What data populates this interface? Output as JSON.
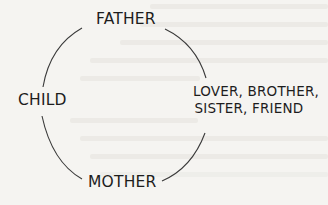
{
  "diagram": {
    "type": "cycle",
    "nodes": [
      {
        "id": "father",
        "label": "FATHER"
      },
      {
        "id": "lover",
        "label_lines": [
          "LOVER, BROTHER,",
          "SISTER, FRIEND"
        ]
      },
      {
        "id": "mother",
        "label": "MOTHER"
      },
      {
        "id": "child",
        "label": "CHILD"
      }
    ],
    "edges": [
      {
        "from": "father",
        "to": "lover"
      },
      {
        "from": "lover",
        "to": "mother"
      },
      {
        "from": "mother",
        "to": "child"
      },
      {
        "from": "child",
        "to": "father"
      }
    ]
  },
  "colors": {
    "background": "#f5f4f1",
    "text": "#1d1d1d",
    "arc": "#3a3a3a",
    "bleed_through": "#e3e1dc"
  }
}
